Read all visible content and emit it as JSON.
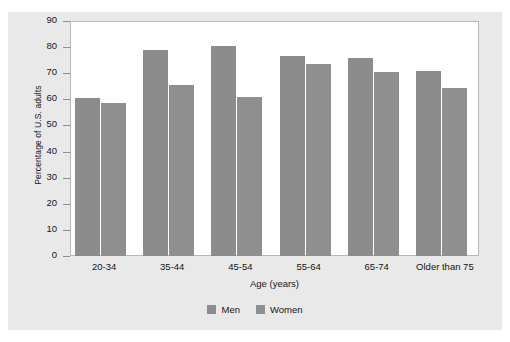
{
  "chart_data": {
    "type": "bar",
    "title": "",
    "xlabel": "Age (years)",
    "ylabel": "Percentage of U.S. adults",
    "categories": [
      "20-34",
      "35-44",
      "45-54",
      "55-64",
      "65-74",
      "Older than 75"
    ],
    "series": [
      {
        "name": "Men",
        "values": [
          60.5,
          79,
          80.5,
          76.5,
          76,
          71
        ],
        "color": "#8c8c8c"
      },
      {
        "name": "Women",
        "values": [
          58.5,
          65.5,
          61,
          73.5,
          70.5,
          64.5
        ],
        "color": "#8f8f8f"
      }
    ],
    "ylim": [
      0,
      90
    ],
    "yticks": [
      0,
      10,
      20,
      30,
      40,
      50,
      60,
      70,
      80,
      90
    ],
    "ytick_labels": [
      "0",
      "10",
      "20",
      "30",
      "40",
      "50",
      "60",
      "70",
      "80",
      "90"
    ],
    "grid": false,
    "legend_position": "bottom-center"
  },
  "figure": {
    "background_color": "#e9e9e9",
    "plot_background_color": "#ffffff",
    "plot_border_color": "#b9b9b9"
  }
}
